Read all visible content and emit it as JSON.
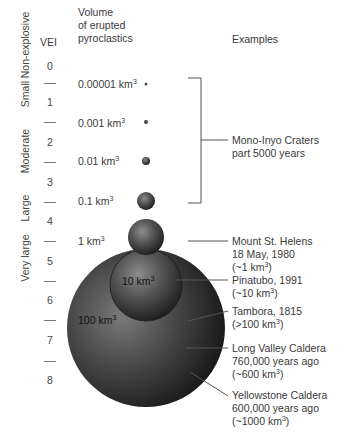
{
  "headers": {
    "vei": "VEI",
    "volume_line1": "Volume",
    "volume_line2": "of erupted",
    "volume_line3": "pyroclastics",
    "examples": "Examples"
  },
  "categories": [
    {
      "label": "Non-explosive",
      "y": 45
    },
    {
      "label": "Small",
      "y": 94
    },
    {
      "label": "Moderate",
      "y": 151
    },
    {
      "label": "Large",
      "y": 208
    },
    {
      "label": "Very large",
      "y": 258
    }
  ],
  "vei_levels": [
    "0",
    "1",
    "2",
    "3",
    "4",
    "5",
    "6",
    "7",
    "8"
  ],
  "volumes": [
    {
      "value": "0.00001 km",
      "sup": "3"
    },
    {
      "value": "0.001 km",
      "sup": "3"
    },
    {
      "value": "0.01 km",
      "sup": "3"
    },
    {
      "value": "0.1 km",
      "sup": "3"
    },
    {
      "value": "1 km",
      "sup": "3"
    },
    {
      "value": "10 km",
      "sup": "3"
    },
    {
      "value": "100 km",
      "sup": "3"
    }
  ],
  "examples": {
    "mono_inyo": {
      "line1": "Mono-Inyo Craters",
      "line2": "part 5000 years"
    },
    "st_helens": {
      "line1": "Mount St. Helens",
      "line2": "18 May, 1980",
      "line3_pre": "(~1 km",
      "line3_post": ")"
    },
    "pinatubo": {
      "line1": "Pinatubo, 1991",
      "line2_pre": "(~10 km",
      "line2_post": ")"
    },
    "tambora": {
      "line1": "Tambora, 1815",
      "line2_pre": "(>100 km",
      "line2_post": ")"
    },
    "long_valley": {
      "line1": "Long Valley Caldera",
      "line2": "760,000 years ago",
      "line3_pre": "(~600 km",
      "line3_post": ")"
    },
    "yellowstone": {
      "line1": "Yellowstone Caldera",
      "line2": "600,000 years ago",
      "line3_pre": "(~1000 km",
      "line3_post": ")"
    }
  },
  "colors": {
    "sphere_dark": "#1e1e1e",
    "sphere_mid": "#555555",
    "sphere_light": "#8a8a8a",
    "line": "#555555"
  }
}
